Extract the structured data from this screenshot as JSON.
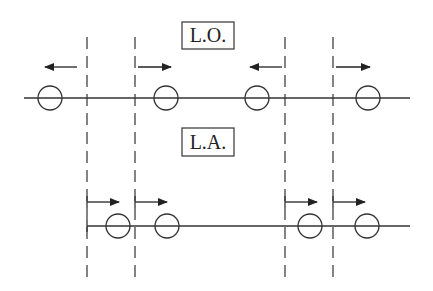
{
  "diagram": {
    "labels": {
      "top": "L.O.",
      "bottom": "L.A."
    },
    "colors": {
      "stroke": "#333333",
      "background": "#ffffff"
    },
    "dashed_lines_x": [
      87,
      135,
      285,
      333
    ],
    "top_row": {
      "line_y": 98,
      "circles_x": [
        50,
        166,
        257,
        368
      ],
      "arrows": [
        {
          "from": 77,
          "to": 45,
          "direction": "left"
        },
        {
          "from": 138,
          "to": 171,
          "direction": "right"
        },
        {
          "from": 282,
          "to": 250,
          "direction": "left"
        },
        {
          "from": 336,
          "to": 370,
          "direction": "right"
        }
      ]
    },
    "bottom_row": {
      "line_y": 226,
      "circles_x": [
        118,
        167,
        310,
        367
      ],
      "arrows": [
        {
          "from": 87,
          "to": 119,
          "direction": "right"
        },
        {
          "from": 135,
          "to": 167,
          "direction": "right"
        },
        {
          "from": 285,
          "to": 317,
          "direction": "right"
        },
        {
          "from": 333,
          "to": 365,
          "direction": "right"
        }
      ]
    }
  }
}
